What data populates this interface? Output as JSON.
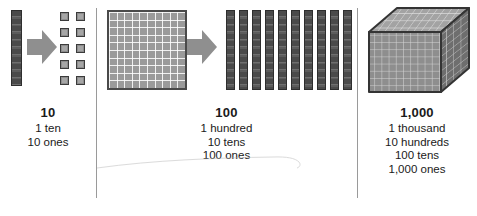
{
  "diagram": {
    "colors": {
      "ink": "#1a1a1a",
      "block_dark": "#4a4a4a",
      "block_mid": "#8d8d8d",
      "block_light": "#a6a6a6",
      "arrow": "#8f8f8f",
      "divider": "#9a9a9a",
      "background": "#ffffff"
    },
    "panels": [
      {
        "id": "ten",
        "value": "10",
        "lines": [
          "1 ten",
          "10 ones"
        ],
        "left_piece": "ten-rod",
        "right_piece": "ten-unit-squares",
        "arrow": "right-block-arrow",
        "unit_count": 10,
        "rod_segments": 10
      },
      {
        "id": "hundred",
        "value": "100",
        "lines": [
          "1 hundred",
          "10 tens",
          "100 ones"
        ],
        "left_piece": "hundred-flat",
        "right_piece": "ten-ten-rods",
        "arrow": "right-block-arrow",
        "flat_rows": 10,
        "flat_cols": 10,
        "rod_count": 10,
        "rod_segments": 10
      },
      {
        "id": "thousand",
        "value": "1,000",
        "lines": [
          "1 thousand",
          "10 hundreds",
          "100 tens",
          "1,000 ones"
        ],
        "left_piece": "thousand-cube",
        "cube_rows": 10,
        "cube_cols": 10
      }
    ],
    "dividers": 2
  }
}
